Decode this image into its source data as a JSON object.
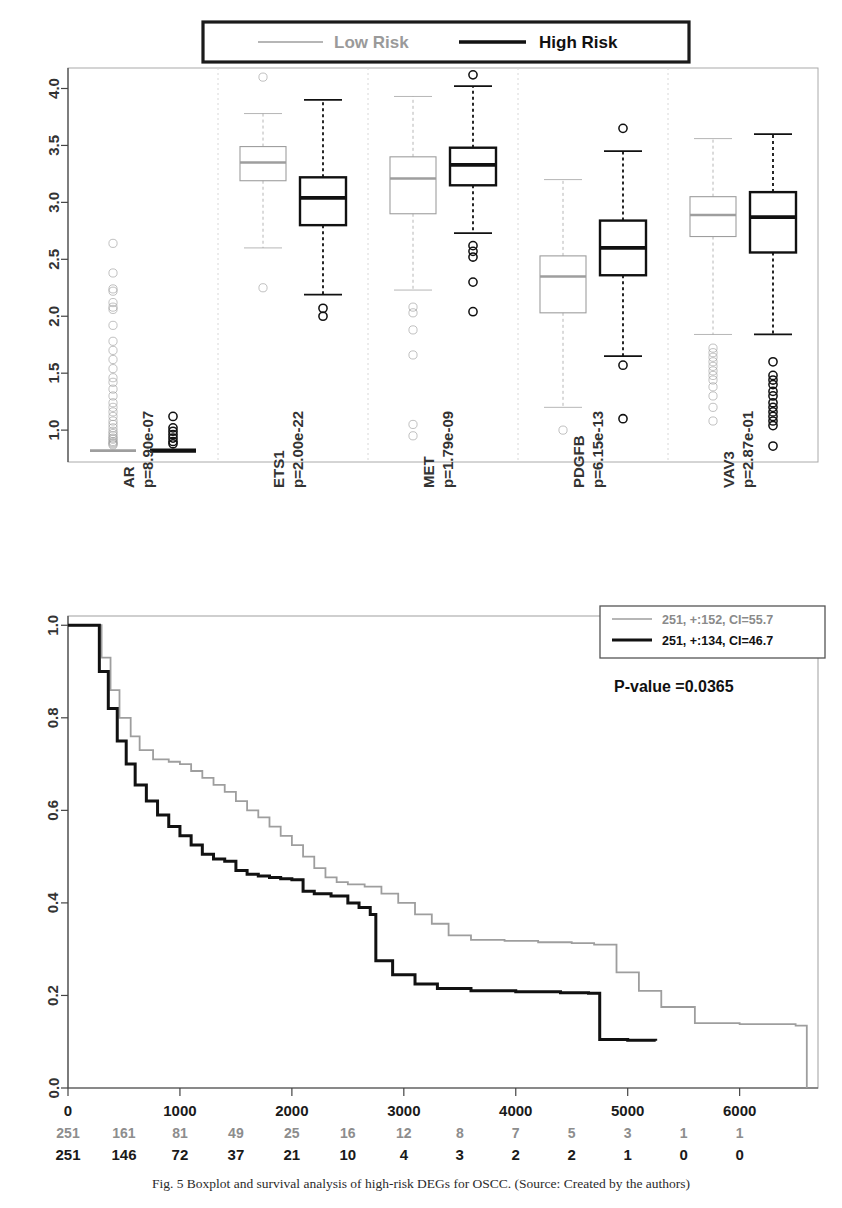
{
  "figure": {
    "background": "#ffffff",
    "gray_color": "#9e9e9e",
    "black_color": "#111111"
  },
  "boxplot_legend": {
    "low_label": "Low Risk",
    "high_label": "High Risk"
  },
  "km_legend": {
    "low_label": "251, +:152, CI=55.7",
    "high_label": "251, +:134, CI=46.7",
    "pvalue_label": "P-value =0.0365"
  },
  "caption": {
    "line1": "Fig. 5  Boxplot and survival analysis of high-risk DEGs for OSCC. (Source: Created by the authors)"
  },
  "chart_data": [
    {
      "type": "boxplot",
      "title": "",
      "xlabel": "",
      "ylabel": "",
      "ylim": [
        0.72,
        4.18
      ],
      "yticks": [
        1.0,
        1.5,
        2.0,
        2.5,
        3.0,
        3.5,
        4.0
      ],
      "ytick_labels": [
        "1.0",
        "1.5",
        "2.0",
        "2.5",
        "3.0",
        "3.5",
        "4.0"
      ],
      "grid": false,
      "legend_position": "top",
      "series_names": [
        "Low Risk",
        "High Risk"
      ],
      "categories": [
        "AR",
        "ETS1",
        "MET",
        "PDGFB",
        "VAV3"
      ],
      "category_pvalues": [
        "p=8.90e-07",
        "p=2.00e-22",
        "p=1.79e-09",
        "p=6.15e-13",
        "p=2.87e-01"
      ],
      "groups": [
        {
          "gene": "AR",
          "pvalue_label": "p=8.90e-07",
          "low": {
            "min": 0.8,
            "q1": 0.8,
            "median": 0.82,
            "q3": 0.83,
            "max": 0.85,
            "outliers": [
              2.64,
              2.38,
              2.24,
              2.22,
              2.12,
              2.08,
              2.06,
              1.92,
              1.78,
              1.7,
              1.62,
              1.54,
              1.46,
              1.42,
              1.36,
              1.3,
              1.24,
              1.2,
              1.16,
              1.12,
              1.08,
              1.05,
              1.02,
              0.99,
              0.97,
              0.95,
              0.93,
              0.92,
              0.9,
              0.89,
              0.88,
              0.87
            ]
          },
          "high": {
            "min": 0.8,
            "q1": 0.8,
            "median": 0.82,
            "q3": 0.83,
            "max": 0.85,
            "outliers": [
              1.12,
              1.02,
              0.99,
              0.96,
              0.93,
              0.9,
              0.88
            ]
          }
        },
        {
          "gene": "ETS1",
          "pvalue_label": "p=2.00e-22",
          "low": {
            "min": 2.6,
            "q1": 3.19,
            "median": 3.35,
            "q3": 3.49,
            "max": 3.78,
            "outliers": [
              4.1,
              2.25
            ]
          },
          "high": {
            "min": 2.19,
            "q1": 2.8,
            "median": 3.04,
            "q3": 3.22,
            "max": 3.9,
            "outliers": [
              2.07,
              2.0
            ]
          }
        },
        {
          "gene": "MET",
          "pvalue_label": "p=1.79e-09",
          "low": {
            "min": 2.23,
            "q1": 2.9,
            "median": 3.21,
            "q3": 3.4,
            "max": 3.93,
            "outliers": [
              2.08,
              2.03,
              1.88,
              1.66,
              1.05,
              0.95
            ]
          },
          "high": {
            "min": 2.73,
            "q1": 3.15,
            "median": 3.33,
            "q3": 3.48,
            "max": 4.02,
            "outliers": [
              4.12,
              2.62,
              2.57,
              2.52,
              2.3,
              2.04
            ]
          }
        },
        {
          "gene": "PDGFB",
          "pvalue_label": "p=6.15e-13",
          "low": {
            "min": 1.2,
            "q1": 2.03,
            "median": 2.35,
            "q3": 2.53,
            "max": 3.2,
            "outliers": [
              1.0
            ]
          },
          "high": {
            "min": 1.65,
            "q1": 2.36,
            "median": 2.6,
            "q3": 2.84,
            "max": 3.45,
            "outliers": [
              3.65,
              1.57,
              1.1
            ]
          }
        },
        {
          "gene": "VAV3",
          "pvalue_label": "p=2.87e-01",
          "low": {
            "min": 1.84,
            "q1": 2.7,
            "median": 2.89,
            "q3": 3.05,
            "max": 3.56,
            "outliers": [
              1.72,
              1.68,
              1.64,
              1.6,
              1.56,
              1.52,
              1.48,
              1.44,
              1.38,
              1.3,
              1.2,
              1.08
            ]
          },
          "high": {
            "min": 1.84,
            "q1": 2.56,
            "median": 2.87,
            "q3": 3.09,
            "max": 3.6,
            "outliers": [
              1.6,
              1.48,
              1.44,
              1.4,
              1.34,
              1.3,
              1.24,
              1.2,
              1.16,
              1.12,
              1.08,
              1.04,
              0.86
            ]
          }
        }
      ]
    },
    {
      "type": "line",
      "subtype": "kaplan-meier",
      "title": "",
      "xlabel": "",
      "ylabel": "",
      "xlim": [
        0,
        6700
      ],
      "ylim": [
        0,
        1.02
      ],
      "xticks": [
        0,
        1000,
        2000,
        3000,
        4000,
        5000,
        6000
      ],
      "xtick_labels": [
        "0",
        "1000",
        "2000",
        "3000",
        "4000",
        "5000",
        "6000"
      ],
      "yticks": [
        0.0,
        0.2,
        0.4,
        0.6,
        0.8,
        1.0
      ],
      "ytick_labels": [
        "0.0",
        "0.2",
        "0.4",
        "0.6",
        "0.8",
        "1.0"
      ],
      "grid": false,
      "legend_position": "top-right",
      "annotation": "P-value =0.0365",
      "series": [
        {
          "name": "251, +:152, CI=55.7",
          "color": "#9e9e9e",
          "points": [
            [
              0,
              1.0
            ],
            [
              180,
              1.0
            ],
            [
              300,
              0.93
            ],
            [
              380,
              0.86
            ],
            [
              460,
              0.8
            ],
            [
              560,
              0.76
            ],
            [
              640,
              0.73
            ],
            [
              760,
              0.71
            ],
            [
              900,
              0.705
            ],
            [
              1000,
              0.7
            ],
            [
              1100,
              0.685
            ],
            [
              1200,
              0.67
            ],
            [
              1300,
              0.655
            ],
            [
              1400,
              0.64
            ],
            [
              1500,
              0.62
            ],
            [
              1600,
              0.6
            ],
            [
              1700,
              0.585
            ],
            [
              1800,
              0.565
            ],
            [
              1900,
              0.545
            ],
            [
              2000,
              0.525
            ],
            [
              2100,
              0.5
            ],
            [
              2200,
              0.475
            ],
            [
              2300,
              0.455
            ],
            [
              2400,
              0.445
            ],
            [
              2500,
              0.44
            ],
            [
              2650,
              0.435
            ],
            [
              2800,
              0.42
            ],
            [
              2950,
              0.4
            ],
            [
              3100,
              0.375
            ],
            [
              3250,
              0.355
            ],
            [
              3400,
              0.33
            ],
            [
              3600,
              0.32
            ],
            [
              3900,
              0.318
            ],
            [
              4200,
              0.315
            ],
            [
              4500,
              0.313
            ],
            [
              4700,
              0.31
            ],
            [
              4900,
              0.25
            ],
            [
              5100,
              0.21
            ],
            [
              5300,
              0.175
            ],
            [
              5600,
              0.14
            ],
            [
              6000,
              0.138
            ],
            [
              6500,
              0.135
            ],
            [
              6600,
              0.0
            ]
          ]
        },
        {
          "name": "251, +:134, CI=46.7",
          "color": "#111111",
          "points": [
            [
              0,
              1.0
            ],
            [
              160,
              1.0
            ],
            [
              280,
              0.9
            ],
            [
              360,
              0.82
            ],
            [
              440,
              0.75
            ],
            [
              520,
              0.7
            ],
            [
              600,
              0.655
            ],
            [
              700,
              0.62
            ],
            [
              800,
              0.59
            ],
            [
              900,
              0.565
            ],
            [
              1000,
              0.545
            ],
            [
              1100,
              0.525
            ],
            [
              1200,
              0.505
            ],
            [
              1300,
              0.495
            ],
            [
              1400,
              0.49
            ],
            [
              1500,
              0.47
            ],
            [
              1600,
              0.462
            ],
            [
              1700,
              0.458
            ],
            [
              1800,
              0.455
            ],
            [
              1900,
              0.452
            ],
            [
              2000,
              0.45
            ],
            [
              2100,
              0.425
            ],
            [
              2200,
              0.42
            ],
            [
              2350,
              0.415
            ],
            [
              2500,
              0.4
            ],
            [
              2600,
              0.39
            ],
            [
              2700,
              0.375
            ],
            [
              2750,
              0.275
            ],
            [
              2900,
              0.245
            ],
            [
              3100,
              0.225
            ],
            [
              3300,
              0.215
            ],
            [
              3600,
              0.21
            ],
            [
              4000,
              0.208
            ],
            [
              4400,
              0.206
            ],
            [
              4650,
              0.205
            ],
            [
              4750,
              0.105
            ],
            [
              5000,
              0.103
            ],
            [
              5250,
              0.102
            ]
          ]
        }
      ],
      "risk_table": {
        "time_points": [
          0,
          500,
          1000,
          1500,
          2000,
          2500,
          3000,
          3500,
          4000,
          4500,
          5000,
          5500,
          6000
        ],
        "rows": [
          {
            "name": "251, +:152, CI=55.7",
            "color": "#9e9e9e",
            "counts": [
              "251",
              "161",
              "81",
              "49",
              "25",
              "16",
              "12",
              "8",
              "7",
              "5",
              "3",
              "1",
              "1"
            ]
          },
          {
            "name": "251, +:134, CI=46.7",
            "color": "#111111",
            "counts": [
              "251",
              "146",
              "72",
              "37",
              "21",
              "10",
              "4",
              "3",
              "2",
              "2",
              "1",
              "0",
              "0"
            ]
          }
        ]
      }
    }
  ]
}
